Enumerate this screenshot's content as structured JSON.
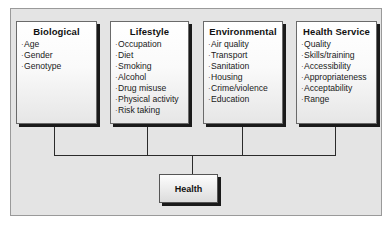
{
  "diagram": {
    "boxes": [
      {
        "title": "Biological",
        "items": [
          "Age",
          "Gender",
          "Genotype"
        ]
      },
      {
        "title": "Lifestyle",
        "items": [
          "Occupation",
          "Diet",
          "Smoking",
          "Alcohol",
          "Drug misuse",
          "Physical activity",
          "Risk taking"
        ]
      },
      {
        "title": "Environmental",
        "items": [
          "Air quality",
          "Transport",
          "Sanitation",
          "Housing",
          "Crime/violence",
          "Education"
        ]
      },
      {
        "title": "Health Service",
        "items": [
          "Quality",
          "Skills/training",
          "Accessibility",
          "Appropriateness",
          "Acceptability",
          "Range"
        ]
      }
    ],
    "target": {
      "label": "Health"
    },
    "bullet": "·"
  }
}
